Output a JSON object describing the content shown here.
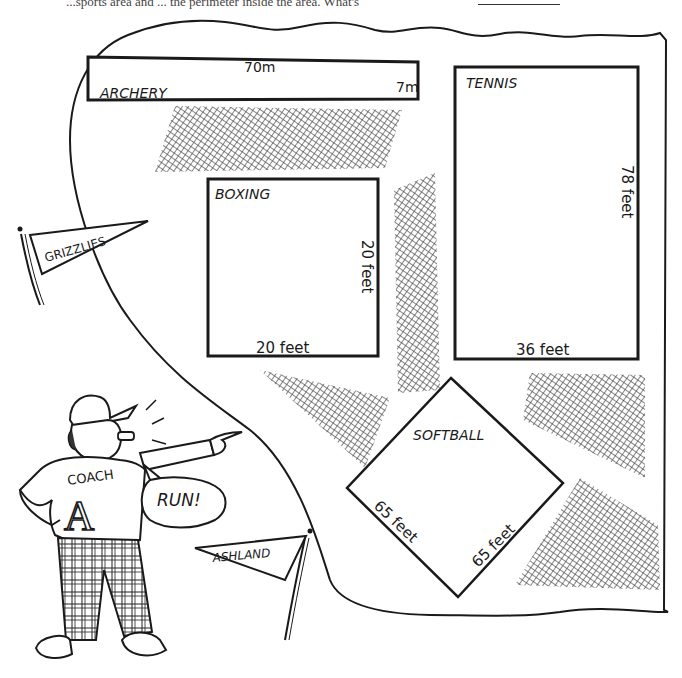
{
  "question": {
    "text_fragment": "...sports area and ... the perimeter inside the area. What's",
    "answer_blank": ""
  },
  "fields": [
    {
      "name": "ARCHERY",
      "shape": "rectangle",
      "length": "70m",
      "width": "7m"
    },
    {
      "name": "TENNIS",
      "shape": "rectangle",
      "length": "78 feet",
      "width": "36 feet"
    },
    {
      "name": "BOXING",
      "shape": "square",
      "length": "20 feet",
      "width": "20 feet"
    },
    {
      "name": "SOFTBALL",
      "shape": "square (diamond)",
      "side_a": "65 feet",
      "side_b": "65 feet"
    }
  ],
  "labels": {
    "archery": "ARCHERY",
    "archery_length": "70m",
    "archery_width": "7m",
    "tennis": "TENNIS",
    "tennis_length": "78 feet",
    "tennis_width": "36 feet",
    "boxing": "BOXING",
    "boxing_side": "20 feet",
    "boxing_bottom": "20 feet",
    "softball": "SOFTBALL",
    "softball_left": "65 feet",
    "softball_right": "65 feet"
  },
  "pennants": {
    "left": "GRIZZLIES",
    "right": "ASHLAND"
  },
  "coach": {
    "shirt_text": "COACH",
    "shirt_letter": "A",
    "speech": "RUN!"
  },
  "colors": {
    "ink": "#1a1a1a",
    "hatch": "#555555",
    "paper": "#ffffff"
  }
}
